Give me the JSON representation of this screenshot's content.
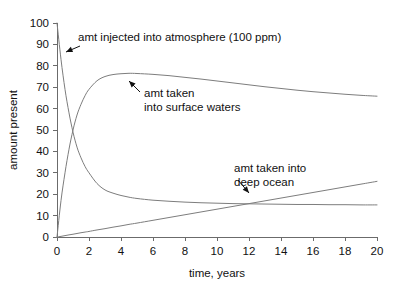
{
  "figure": {
    "background_color": "#ffffff",
    "axis_color": "#6b6b6b",
    "curve_color": "#7d7d7d",
    "text_color": "#111111"
  },
  "chart_data": {
    "type": "line",
    "title": "",
    "xlabel": "time, years",
    "ylabel": "amount present",
    "xlim": [
      0,
      20
    ],
    "ylim": [
      0,
      100
    ],
    "grid": false,
    "legend": "none",
    "xticks": [
      0,
      2,
      4,
      6,
      8,
      10,
      12,
      14,
      16,
      18,
      20
    ],
    "yticks": [
      0,
      10,
      20,
      30,
      40,
      50,
      60,
      70,
      80,
      90,
      100
    ],
    "x": [
      0,
      0.25,
      0.5,
      0.75,
      1,
      1.25,
      1.5,
      1.75,
      2,
      2.5,
      3,
      3.5,
      4,
      4.5,
      5,
      6,
      7,
      8,
      9,
      10,
      11,
      12,
      13,
      14,
      15,
      16,
      17,
      18,
      19,
      20
    ],
    "series": [
      {
        "name": "amt injected into atmosphere (100 ppm)",
        "values": [
          100,
          83,
          69,
          58,
          49,
          42,
          37,
          33,
          30,
          25,
          22,
          20.5,
          19.4,
          18.6,
          18,
          17.2,
          16.7,
          16.3,
          16,
          15.8,
          15.6,
          15.5,
          15.4,
          15.3,
          15.2,
          15.2,
          15.1,
          15.1,
          15.0,
          15.0
        ]
      },
      {
        "name": "amt taken into surface waters",
        "values": [
          0,
          17,
          30,
          41,
          50,
          57,
          62,
          66,
          69,
          73,
          75,
          75.9,
          76.3,
          76.5,
          76.4,
          76.0,
          75.4,
          74.6,
          73.8,
          72.9,
          72.0,
          71.1,
          70.2,
          69.4,
          68.6,
          67.9,
          67.3,
          66.7,
          66.2,
          65.8
        ]
      },
      {
        "name": "amt taken into deep ocean",
        "values": [
          0,
          0.3,
          0.65,
          1.0,
          1.3,
          1.65,
          2.0,
          2.3,
          2.6,
          3.3,
          3.9,
          4.6,
          5.2,
          5.9,
          6.5,
          7.8,
          9.1,
          10.4,
          11.7,
          13.0,
          14.3,
          15.6,
          16.9,
          18.2,
          19.5,
          20.8,
          22.1,
          23.4,
          24.7,
          26.0
        ]
      }
    ],
    "annotations": [
      {
        "id": "atmosphere",
        "lines": [
          "amt injected into atmosphere (100 ppm)"
        ],
        "text_x": 78,
        "text_y": 41,
        "leader_from": [
          80,
          46
        ],
        "leader_to": [
          66,
          52
        ]
      },
      {
        "id": "surface-waters",
        "lines": [
          "amt taken",
          "into surface waters"
        ],
        "text_x": 144,
        "text_y": 97,
        "leader_from": [
          140,
          92
        ],
        "leader_to": [
          129,
          81
        ]
      },
      {
        "id": "deep-ocean",
        "lines": [
          "amt taken into",
          "deep ocean"
        ],
        "text_x": 234,
        "text_y": 172,
        "leader_from": [
          238,
          180
        ],
        "leader_to": [
          249,
          193
        ]
      }
    ]
  }
}
